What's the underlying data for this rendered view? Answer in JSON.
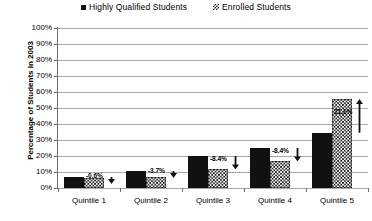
{
  "legend": {
    "items": [
      {
        "label": "Highly Qualified Students",
        "marker": "solid-square-icon"
      },
      {
        "label": "Enrolled Students",
        "marker": "checkered-square-icon"
      }
    ]
  },
  "axes": {
    "y_title": "Percentage of Students in 2003",
    "y_ticks": [
      "100%",
      "90%",
      "80%",
      "70%",
      "60%",
      "50%",
      "40%",
      "30%",
      "20%",
      "10%",
      "0%"
    ],
    "x_ticks": [
      "Quintile 1",
      "Quintile 2",
      "Quintile 3",
      "Quintile 4",
      "Quintile 5"
    ]
  },
  "annotations": [
    {
      "text": "-0.6%",
      "direction": "down"
    },
    {
      "text": "-3.7%",
      "direction": "down"
    },
    {
      "text": "-8.4%",
      "direction": "down"
    },
    {
      "text": "-8.4%",
      "direction": "down"
    },
    {
      "text": "21.1%",
      "direction": "up"
    }
  ],
  "chart_data": {
    "type": "bar",
    "title": "",
    "xlabel": "",
    "ylabel": "Percentage of Students in 2003",
    "ylim": [
      0,
      100
    ],
    "ytick_step": 10,
    "grid": true,
    "legend_position": "top-center",
    "categories": [
      "Quintile 1",
      "Quintile 2",
      "Quintile 3",
      "Quintile 4",
      "Quintile 5"
    ],
    "series": [
      {
        "name": "Highly Qualified Students",
        "values": [
          7.0,
          10.5,
          20.0,
          25.0,
          34.5
        ]
      },
      {
        "name": "Enrolled Students",
        "values": [
          6.4,
          6.8,
          11.6,
          16.6,
          55.6
        ]
      }
    ],
    "difference_labels": [
      "-0.6%",
      "-3.7%",
      "-8.4%",
      "-8.4%",
      "21.1%"
    ],
    "difference_values": [
      -0.6,
      -3.7,
      -8.4,
      -8.4,
      21.1
    ]
  }
}
